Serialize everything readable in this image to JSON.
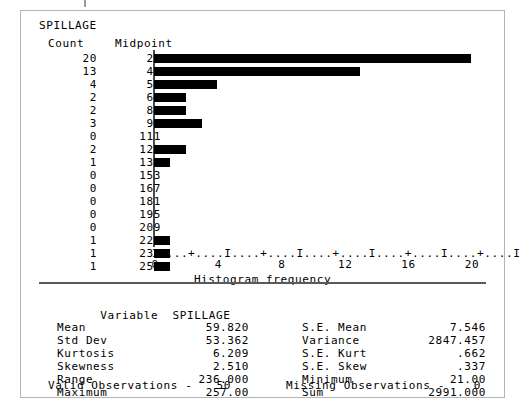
{
  "variable_title": "SPILLAGE",
  "histogram": {
    "headers": {
      "count": "Count",
      "midpoint": "Midpoint"
    },
    "axis_char_line": "I....+....I....+....I....+....I....+....I....+....I",
    "axis_title": "Histogram frequency",
    "axis_ticks": [
      "0",
      "4",
      "8",
      "12",
      "16",
      "20"
    ],
    "bar_color": "#000000",
    "rows": [
      {
        "count": "20",
        "midpoint": "27",
        "value": 20
      },
      {
        "count": "13",
        "midpoint": "41",
        "value": 13
      },
      {
        "count": "4",
        "midpoint": "55",
        "value": 4
      },
      {
        "count": "2",
        "midpoint": "69",
        "value": 2
      },
      {
        "count": "2",
        "midpoint": "83",
        "value": 2
      },
      {
        "count": "3",
        "midpoint": "97",
        "value": 3
      },
      {
        "count": "0",
        "midpoint": "111",
        "value": 0
      },
      {
        "count": "2",
        "midpoint": "125",
        "value": 2
      },
      {
        "count": "1",
        "midpoint": "139",
        "value": 1
      },
      {
        "count": "0",
        "midpoint": "153",
        "value": 0
      },
      {
        "count": "0",
        "midpoint": "167",
        "value": 0
      },
      {
        "count": "0",
        "midpoint": "181",
        "value": 0
      },
      {
        "count": "0",
        "midpoint": "195",
        "value": 0
      },
      {
        "count": "0",
        "midpoint": "209",
        "value": 0
      },
      {
        "count": "1",
        "midpoint": "223",
        "value": 1
      },
      {
        "count": "1",
        "midpoint": "237",
        "value": 1
      },
      {
        "count": "1",
        "midpoint": "251",
        "value": 1
      }
    ]
  },
  "chart_data": {
    "type": "bar",
    "title": "SPILLAGE",
    "xlabel": "Histogram frequency",
    "ylabel": "Midpoint",
    "orientation": "horizontal",
    "categories": [
      "27",
      "41",
      "55",
      "69",
      "83",
      "97",
      "111",
      "125",
      "139",
      "153",
      "167",
      "181",
      "195",
      "209",
      "223",
      "237",
      "251"
    ],
    "values": [
      20,
      13,
      4,
      2,
      2,
      3,
      0,
      2,
      1,
      0,
      0,
      0,
      0,
      0,
      1,
      1,
      1
    ],
    "xlim": [
      0,
      20
    ],
    "xticks": [
      0,
      4,
      8,
      12,
      16,
      20
    ],
    "grid": false,
    "legend": "none"
  },
  "statistics": {
    "variable_label": "Variable",
    "variable_name": "SPILLAGE",
    "left": [
      {
        "label": "Mean",
        "value": "59.820"
      },
      {
        "label": "Std Dev",
        "value": "53.362"
      },
      {
        "label": "Kurtosis",
        "value": "6.209"
      },
      {
        "label": "Skewness",
        "value": "2.510"
      },
      {
        "label": "Range",
        "value": "236.000"
      },
      {
        "label": "Maximum",
        "value": "257.00"
      }
    ],
    "right": [
      {
        "label": "S.E. Mean",
        "value": "7.546"
      },
      {
        "label": "Variance",
        "value": "2847.457"
      },
      {
        "label": "S.E. Kurt",
        "value": ".662"
      },
      {
        "label": "S.E. Skew",
        "value": ".337"
      },
      {
        "label": "Minimum",
        "value": "21.00"
      },
      {
        "label": "Sum",
        "value": "2991.000"
      }
    ]
  },
  "observations": {
    "valid_label": "Valid Observations -",
    "valid_value": "50",
    "missing_label": "Missing Observations -",
    "missing_value": "0"
  }
}
